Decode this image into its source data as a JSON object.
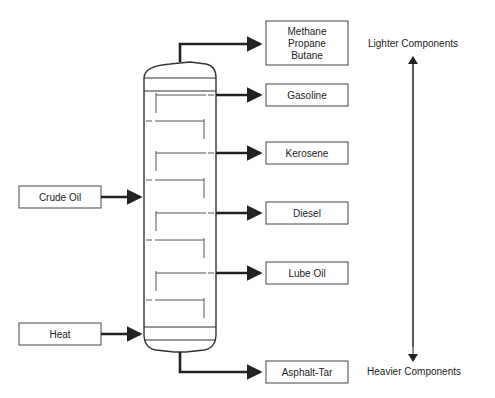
{
  "diagram": {
    "inputs": [
      {
        "id": "crude",
        "label": "Crude Oil"
      },
      {
        "id": "heat",
        "label": "Heat"
      }
    ],
    "outputs": [
      {
        "id": "gases",
        "lines": [
          "Methane",
          "Propane",
          "Butane"
        ]
      },
      {
        "id": "gasoline",
        "lines": [
          "Gasoline"
        ]
      },
      {
        "id": "kerosene",
        "lines": [
          "Kerosene"
        ]
      },
      {
        "id": "diesel",
        "lines": [
          "Diesel"
        ]
      },
      {
        "id": "lube",
        "lines": [
          "Lube Oil"
        ]
      },
      {
        "id": "asphalt",
        "lines": [
          "Asphalt-Tar"
        ]
      }
    ],
    "scale": {
      "top_label": "Lighter Components",
      "bottom_label": "Heavier Components"
    },
    "colors": {
      "line": "#222222",
      "box_border": "#444444",
      "background": "#ffffff"
    }
  }
}
